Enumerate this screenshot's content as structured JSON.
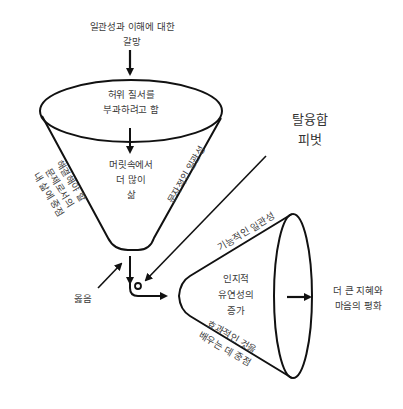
{
  "diagram": {
    "top_label": [
      "일관성과 이해에 대한",
      "갈망"
    ],
    "funnel": {
      "top_label": [
        "허위 질서를",
        "부과하려고 함"
      ],
      "inner_label": [
        "머릿속에서",
        "더 많이",
        "삶"
      ],
      "left_side_label": [
        "해결해야 할",
        "문제로서의",
        "내 삶에 중점"
      ],
      "right_side_label": "문자적인 일관성"
    },
    "pivot_label": [
      "탈융합",
      "피벗"
    ],
    "right_label": "옳음",
    "cone": {
      "top_side_label": "기능적인 일관성",
      "inner_label": [
        "인지적",
        "유연성의",
        "증가"
      ],
      "bottom_side_label": [
        "효과적인 것을",
        "배우는 데 중점"
      ]
    },
    "outcome_label": [
      "더 큰 지혜와",
      "마음의 평화"
    ],
    "colors": {
      "stroke": "#111111",
      "text": "#3a3a3a",
      "background": "#ffffff"
    }
  }
}
